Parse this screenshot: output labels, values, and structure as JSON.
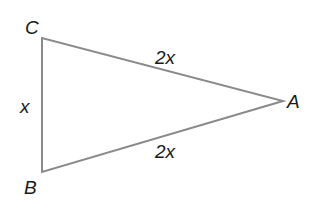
{
  "figure": {
    "type": "triangle",
    "stroke_color": "#8a8a8a",
    "label_color": "#1a1a1a",
    "vertices": [
      {
        "name": "C",
        "x": 42,
        "y": 38,
        "label_x": 25,
        "label_y": 34
      },
      {
        "name": "B",
        "x": 42,
        "y": 172,
        "label_x": 24,
        "label_y": 194
      },
      {
        "name": "A",
        "x": 283,
        "y": 101,
        "label_x": 287,
        "label_y": 108
      }
    ],
    "sides": [
      {
        "name": "CB",
        "from": "C",
        "to": "B",
        "length_label": "x",
        "label_x": 20,
        "label_y": 113
      },
      {
        "name": "CA",
        "from": "C",
        "to": "A",
        "length_label": "2x",
        "label_x": 155,
        "label_y": 64
      },
      {
        "name": "BA",
        "from": "B",
        "to": "A",
        "length_label": "2x",
        "label_x": 155,
        "label_y": 158
      }
    ]
  }
}
